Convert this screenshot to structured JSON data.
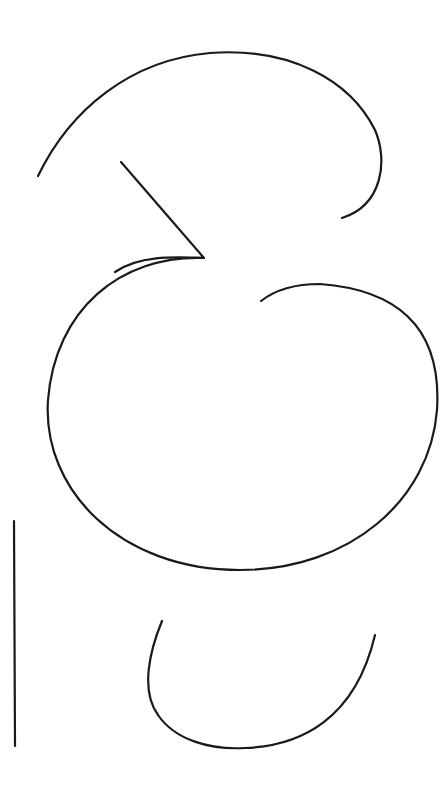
{
  "drawing": {
    "background": "#ffffff",
    "stroke_color": "#1a1a1a",
    "stroke_width": 2.2,
    "strokes": [
      {
        "name": "top-arc",
        "d": "M38,176 C70,110 130,60 210,53 C290,47 350,80 375,130 C388,160 383,205 342,218"
      },
      {
        "name": "diagonal-line",
        "d": "M121,162 L204,258 C175,257 140,255 115,272"
      },
      {
        "name": "big-loop",
        "d": "M204,258 C120,255 55,310 48,400 C42,490 120,570 240,570 C350,570 430,500 437,410 C442,330 400,290 320,284 C295,284 275,290 261,301"
      },
      {
        "name": "vertical-line",
        "d": "M14,521 L15,746"
      },
      {
        "name": "bottom-u",
        "d": "M162,621 C150,650 140,690 158,715 C175,740 210,750 245,748 C300,746 355,720 375,635"
      }
    ]
  }
}
